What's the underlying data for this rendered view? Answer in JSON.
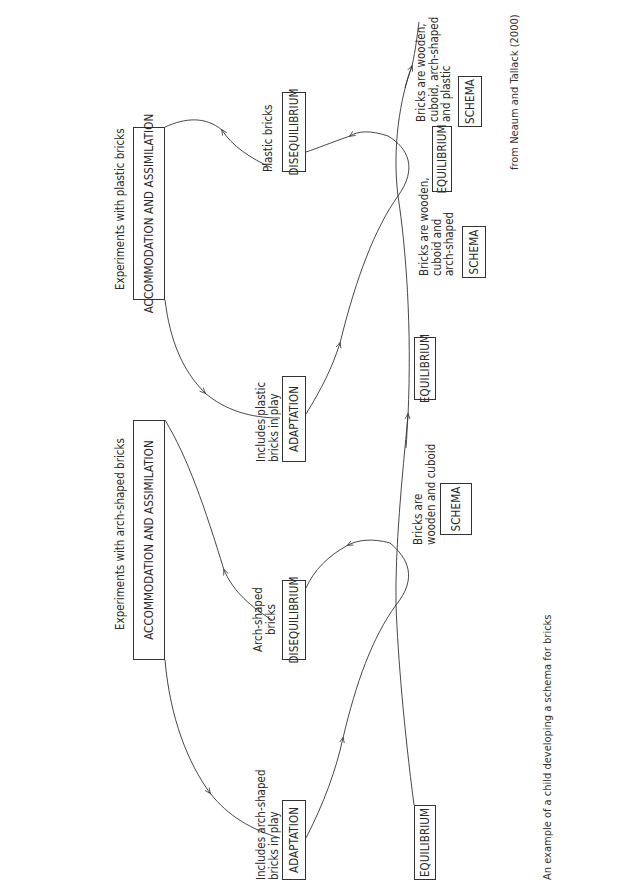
{
  "figure": {
    "title": "An example of a child developing a schema for bricks",
    "source": "from Neaum and Tallack (2000)"
  },
  "cycle1": {
    "heading": "Experiments with arch-shaped bricks",
    "accommodation": "ACCOMMODATION AND ASSIMILATION",
    "adaptation": "ADAPTATION",
    "adaptation_note": "Includes arch-shaped\nbricks in play",
    "disequilibrium": "DISEQUILIBRIUM",
    "disequilibrium_note": "Arch-shaped\nbricks"
  },
  "cycle2": {
    "heading": "Experiments with plastic bricks",
    "accommodation": "ACCOMMODATION AND ASSIMILATION",
    "adaptation": "ADAPTATION",
    "adaptation_note": "Includes plastic\nbricks in play",
    "disequilibrium": "DISEQUILIBRIUM",
    "disequilibrium_note": "Plastic bricks"
  },
  "timeline": {
    "equilibrium_1": "EQUILIBRIUM",
    "equilibrium_2": "EQUILIBRIUM",
    "equilibrium_3": "EQUILIBRIUM",
    "schema_1_note": "Bricks are\nwooden and cuboid",
    "schema_1": "SCHEMA",
    "schema_2_note": "Bricks are wooden,\ncuboid and\narch-shaped",
    "schema_2": "SCHEMA",
    "schema_3_note": "Bricks are wooden,\ncuboid, arch-shaped\nand plastic",
    "schema_3": "SCHEMA"
  }
}
